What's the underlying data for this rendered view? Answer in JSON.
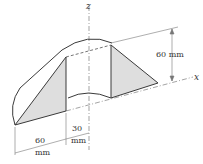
{
  "figure": {
    "axes": {
      "z_label": "z",
      "x_label": "x"
    },
    "dimensions": {
      "height": "60 mm",
      "bottom_left_value": "60",
      "bottom_left_unit": "mm",
      "bottom_right_value": "30",
      "bottom_right_unit": "mm"
    },
    "colors": {
      "line": "#3a3a3a",
      "shade": "#dcdcdc",
      "thin": "#777777"
    }
  }
}
